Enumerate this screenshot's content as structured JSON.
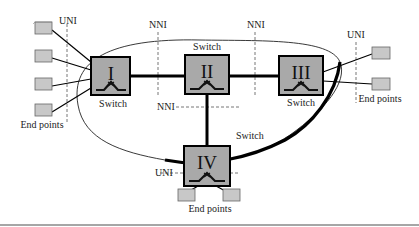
{
  "diagram": {
    "switches": [
      {
        "id": "I",
        "numeral": "I",
        "label": "Switch"
      },
      {
        "id": "II",
        "numeral": "II",
        "label": "Switch"
      },
      {
        "id": "III",
        "numeral": "III",
        "label": "Switch"
      },
      {
        "id": "IV",
        "numeral": "IV",
        "label": "Switch"
      }
    ],
    "interfaces": {
      "uni_left": "UNI",
      "nni_left": "NNI",
      "nni_right": "NNI",
      "uni_right": "UNI",
      "nni_middle": "NNI",
      "uni_bottom": "UNI"
    },
    "endpoint_groups": {
      "left": "End points",
      "right": "End points",
      "bottom": "End points"
    },
    "colors": {
      "switch_fill": "#a9a9a9",
      "endpoint_fill": "#c8c8c8",
      "link": "#000000",
      "dashed": "#777777"
    }
  }
}
